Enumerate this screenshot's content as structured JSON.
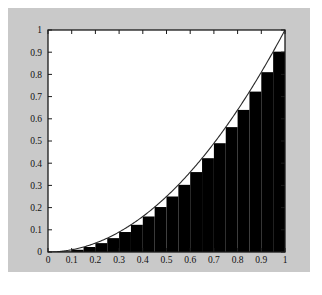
{
  "figure": {
    "background_color": "#c9c9c9",
    "page_color": "#ffffff",
    "plot_background_color": "#ffffff",
    "axis_color": "#1a1a1a",
    "bar_color": "#000000",
    "curve_color": "#2a2a2a",
    "tick_label_color": "#111111"
  },
  "chart_data": {
    "type": "bar",
    "title": "",
    "subtitle": "",
    "xlabel": "",
    "ylabel": "",
    "xlim": [
      0,
      1
    ],
    "ylim": [
      0,
      1
    ],
    "grid": false,
    "legend": null,
    "legend_position": "none",
    "xticks": [
      0,
      0.1,
      0.2,
      0.3,
      0.4,
      0.5,
      0.6,
      0.7,
      0.8,
      0.9,
      1
    ],
    "xticklabels": [
      "0",
      "0.1",
      "0.2",
      "0.3",
      "0.4",
      "0.5",
      "0.6",
      "0.7",
      "0.8",
      "0.9",
      "1"
    ],
    "yticks": [
      0,
      0.1,
      0.2,
      0.3,
      0.4,
      0.5,
      0.6,
      0.7,
      0.8,
      0.9,
      1
    ],
    "yticklabels": [
      "0",
      "0.1",
      "0.2",
      "0.3",
      "0.4",
      "0.5",
      "0.6",
      "0.7",
      "0.8",
      "0.9",
      "1"
    ],
    "tick_direction": "in",
    "tick_sides": [
      "left",
      "bottom",
      "top",
      "right"
    ],
    "annotation": "Lower Riemann sum of y = x^2 on [0,1] with 20 subintervals of width 0.05; each bar height equals the function value at the left endpoint of its subinterval.",
    "bar_width": 0.05,
    "bar_count": 20,
    "bar_align": "left-endpoint",
    "categories": [
      "0.00",
      "0.05",
      "0.10",
      "0.15",
      "0.20",
      "0.25",
      "0.30",
      "0.35",
      "0.40",
      "0.45",
      "0.50",
      "0.55",
      "0.60",
      "0.65",
      "0.70",
      "0.75",
      "0.80",
      "0.85",
      "0.90",
      "0.95"
    ],
    "values": [
      0.0,
      0.0025,
      0.01,
      0.0225,
      0.04,
      0.0625,
      0.09,
      0.1225,
      0.16,
      0.2025,
      0.25,
      0.3025,
      0.36,
      0.4225,
      0.49,
      0.5625,
      0.64,
      0.7225,
      0.81,
      0.9025
    ],
    "series": [
      {
        "name": "Lower Riemann sum bars",
        "type": "bar",
        "values": [
          0.0,
          0.0025,
          0.01,
          0.0225,
          0.04,
          0.0625,
          0.09,
          0.1225,
          0.16,
          0.2025,
          0.25,
          0.3025,
          0.36,
          0.4225,
          0.49,
          0.5625,
          0.64,
          0.7225,
          0.81,
          0.9025
        ]
      },
      {
        "name": "y = x^2",
        "type": "line",
        "x": [
          0.0,
          0.05,
          0.1,
          0.15,
          0.2,
          0.25,
          0.3,
          0.35,
          0.4,
          0.45,
          0.5,
          0.55,
          0.6,
          0.65,
          0.7,
          0.75,
          0.8,
          0.85,
          0.9,
          0.95,
          1.0
        ],
        "values": [
          0.0,
          0.0025,
          0.01,
          0.0225,
          0.04,
          0.0625,
          0.09,
          0.1225,
          0.16,
          0.2025,
          0.25,
          0.3025,
          0.36,
          0.4225,
          0.49,
          0.5625,
          0.64,
          0.7225,
          0.81,
          0.9025,
          1.0
        ]
      }
    ]
  }
}
